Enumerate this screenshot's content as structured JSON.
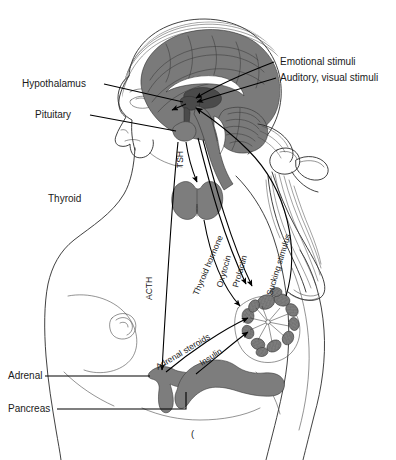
{
  "figure": {
    "background_color": "#ffffff",
    "ink_color": "#1a1a1a",
    "gland_fill_color": "#7d7d7d",
    "brain_fill_color": "#7a7a7a"
  },
  "labels": {
    "hypothalamus": "Hypothalamus",
    "pituitary": "Pituitary",
    "thyroid": "Thyroid",
    "adrenal": "Adrenal",
    "pancreas": "Pancreas",
    "emotional_stimuli": "Emotional stimuli",
    "auditory_visual_stimuli": "Auditory, visual stimuli"
  },
  "pathways": {
    "tsh": "TSH",
    "thyroid_hormone": "Thyroid hormone",
    "oxytocin": "Oxytocin",
    "prolactin": "Prolactin",
    "sucking_stimulus": "Sucking stimulus",
    "acth": "ACTH",
    "adrenal_steroids": "Adrenal steroids",
    "insulin": "Insulin"
  },
  "structures": {
    "brain": "brain",
    "cerebellum": "cerebellum",
    "brainstem": "brainstem",
    "pituitary_gland": "pituitary-gland",
    "thyroid_gland": "thyroid-gland",
    "adrenal_gland": "adrenal-gland",
    "pancreas_gland": "pancreas-gland",
    "mammary_gland": "mammary-gland",
    "head_profile": "head-profile",
    "torso": "torso",
    "ponytail": "ponytail",
    "hair_ribbon": "hair-ribbon"
  },
  "artifact": {
    "mark": "("
  }
}
